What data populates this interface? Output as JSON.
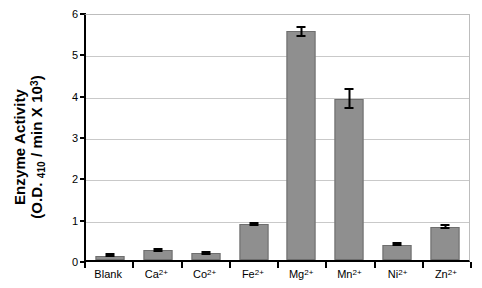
{
  "chart_data": {
    "type": "bar",
    "title": "",
    "xlabel": "",
    "ylabel": "Enzyme Activity (O.D. 410 / min X 10^3)",
    "ylabel_line1": "Enzyme Activity",
    "ylabel_line2_prefix": "(O.D. ",
    "ylabel_line2_sub": "410",
    "ylabel_line2_mid": " / min X 10",
    "ylabel_line2_sup": "3",
    "ylabel_line2_suffix": ")",
    "categories": [
      "Blank",
      "Ca2+",
      "Co2+",
      "Fe2+",
      "Mg2+",
      "Mn2+",
      "Ni2+",
      "Zn2+"
    ],
    "category_labels": [
      {
        "base": "Blank",
        "sup": ""
      },
      {
        "base": "Ca",
        "sup": "2+"
      },
      {
        "base": "Co",
        "sup": "2+"
      },
      {
        "base": "Fe",
        "sup": "2+"
      },
      {
        "base": "Mg",
        "sup": "2+"
      },
      {
        "base": "Mn",
        "sup": "2+"
      },
      {
        "base": "Ni",
        "sup": "2+"
      },
      {
        "base": "Zn",
        "sup": "2+"
      }
    ],
    "values": [
      0.1,
      0.24,
      0.16,
      0.86,
      5.53,
      3.9,
      0.36,
      0.81
    ],
    "errors": [
      0.02,
      0.05,
      0.03,
      0.04,
      0.13,
      0.25,
      0.03,
      0.07
    ],
    "ylim": [
      0,
      6
    ],
    "yticks": [
      0,
      1,
      2,
      3,
      4,
      5,
      6
    ],
    "ytick_labels": [
      "0",
      "1",
      "2",
      "3",
      "4",
      "5",
      "6"
    ],
    "grid": true,
    "grid_axis": "y",
    "legend": false,
    "bar_color": "#8f8f8f",
    "bar_edge_color": "#6e6e6e",
    "grid_color": "#c9c9c9",
    "axis_color": "#000000",
    "error_bar_color": "#000000"
  }
}
